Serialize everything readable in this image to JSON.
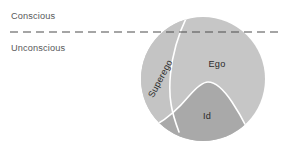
{
  "diagram": {
    "levels": [
      {
        "id": "conscious",
        "label": "Conscious",
        "x": 11,
        "y": 19
      },
      {
        "id": "unconscious",
        "label": "Unconscious",
        "x": 11,
        "y": 51
      }
    ],
    "divider": {
      "name": "conscious-unconscious-divider",
      "style": "dashed",
      "y": 32,
      "x1": 10,
      "x2": 283,
      "color": "#4d4d4d",
      "dash": "8 5",
      "width": 1.1
    },
    "circle": {
      "cx": 203,
      "cy": 79,
      "r": 62,
      "fill": "#c6c6c6"
    },
    "regions": [
      {
        "id": "superego",
        "label": "Superego",
        "fill": "#c4c4c4",
        "label_x": 163,
        "label_y": 80,
        "label_rotation": -62
      },
      {
        "id": "ego",
        "label": "Ego",
        "fill": "#c6c6c6",
        "label_x": 217,
        "label_y": 67,
        "label_rotation": 0
      },
      {
        "id": "id",
        "label": "Id",
        "fill": "#a9a9a9",
        "label_x": 207,
        "label_y": 119,
        "label_rotation": 0
      }
    ],
    "boundaries": [
      {
        "id": "superego-ego-boundary",
        "color": "#ffffff",
        "width": 1.6,
        "path": "M 186.5 17.4 C 178.5 34 172.5 54 170.5 74 C 169.3 86 169.6 96 171.2 105"
      },
      {
        "id": "id-boundary",
        "color": "#ffffff",
        "width": 1.6,
        "path": "M 156.5 124.5 C 168 118 179 108 189 96 C 196 88 202 82 208 82 C 216 82 224 90 232 102 C 238 111 243 120 247 128"
      }
    ]
  }
}
